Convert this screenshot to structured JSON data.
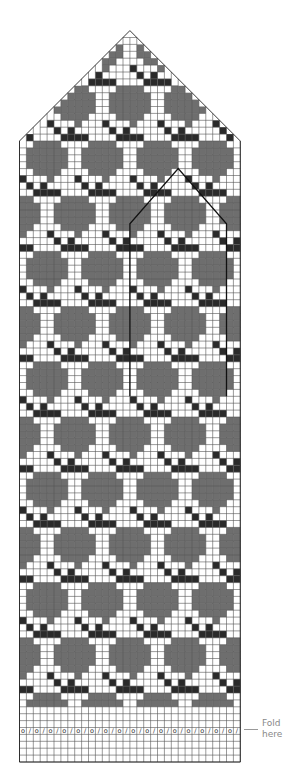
{
  "chart_data": {
    "type": "knitting-chart",
    "columns": 32,
    "rows": 106,
    "cell_size_px": 6.9,
    "origin": {
      "x": 19.5,
      "y_bottom": 762
    },
    "colors": {
      "background": "#ffffff",
      "grid": "#555555",
      "contrast_gray": "#6e6e6e",
      "contrast_black": "#2a2a2a",
      "outline": "#222222"
    },
    "legend": {
      "0": "background (white)",
      "1": "gray contrast stitch",
      "2": "black contrast stitch"
    },
    "motif": {
      "width": 8,
      "height": 16,
      "half_drop_offset_cols": 4,
      "description": "Gray rounded blob (flower) above a black X-shaped cross with a black block; repeats every 8 columns, offset by 4 columns every 8 rows",
      "cells_top_to_bottom": [
        "00111100",
        "01111110",
        "01111110",
        "01111110",
        "00111100",
        "20001000",
        "02020000",
        "00222200",
        "00222200",
        "20000000",
        "00000000",
        "00000000",
        "00000000",
        "00000000",
        "00000000",
        "00000000"
      ]
    },
    "pattern_rows_from_bottom": {
      "start": 9,
      "end": 96
    },
    "fold_row_from_bottom": 5,
    "fold_row_symbols": [
      "o",
      "/"
    ],
    "top_shaping": {
      "start_row_from_bottom": 90,
      "tip_row_from_bottom": 106,
      "decrease": "1 stitch each side every row"
    },
    "thumb_outline": {
      "left_col": 16,
      "right_col": 30,
      "bottom_row_from_bottom": 53,
      "shoulder_row_from_bottom": 78,
      "tip_col": 23,
      "tip_row_from_bottom": 86
    }
  },
  "annotations": {
    "fold_label_line1": "Fold",
    "fold_label_line2": "here"
  }
}
